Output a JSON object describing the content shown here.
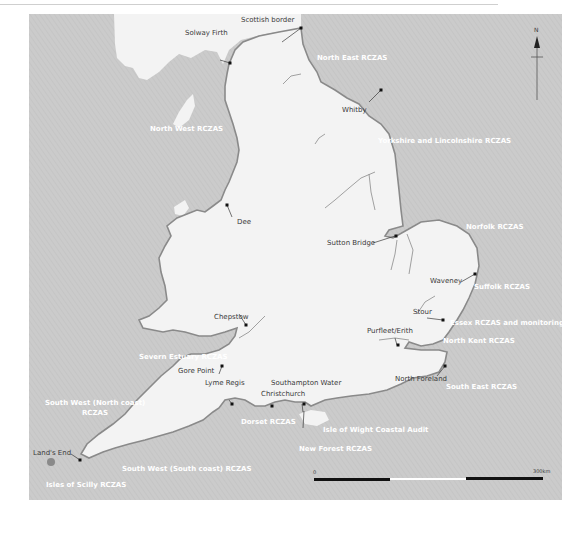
{
  "map": {
    "colors": {
      "sea": "#cccccc",
      "land": "#f3f3f3",
      "coast_region": "#9a9a9a",
      "label_dark": "#3a3a3a",
      "label_region": "#ffffff"
    },
    "place_labels": {
      "scottish_border": "Scottish border",
      "solway_firth": "Solway Firth",
      "whitby": "Whitby",
      "dee": "Dee",
      "sutton_bridge": "Sutton Bridge",
      "waveney": "Waveney",
      "stour": "Stour",
      "purfleet_erith": "Purfleet/Erith",
      "north_foreland": "North Foreland",
      "chepstow": "Chepstow",
      "gore_point": "Gore Point",
      "lyme_regis": "Lyme Regis",
      "christchurch": "Christchurch",
      "southampton_water": "Southampton Water",
      "lands_end": "Land's End"
    },
    "region_labels": {
      "north_east": "North East RCZAS",
      "yorkshire_lincolnshire": "Yorkshire and Lincolnshire RCZAS",
      "north_west": "North West RCZAS",
      "norfolk": "Norfolk RCZAS",
      "suffolk": "Suffolk RCZAS",
      "essex": "Essex RCZAS  and monitoring",
      "north_kent": "North Kent RCZAS",
      "south_east": "South East RCZAS",
      "severn_estuary": "Severn Estuary RCZAS",
      "south_west_north_1": "South West (North coast)",
      "south_west_north_2": "RCZAS",
      "dorset": "Dorset RCZAS",
      "isle_of_wight": "Isle of Wight Coastal Audit",
      "new_forest": "New Forest RCZAS",
      "south_west_south": "South West (South coast) RCZAS",
      "isles_of_scilly": "Isles of Scilly RCZAS"
    },
    "north_arrow": {
      "label": "N"
    },
    "scale_bar": {
      "start_label": "0",
      "end_label": "300km"
    }
  }
}
